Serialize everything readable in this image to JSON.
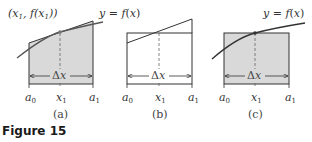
{
  "figure_label": "Figure 15",
  "panels": [
    {
      "id": "a",
      "caption": "(a)",
      "point_label": "(x₁, f(x₁))",
      "curve_label": "",
      "description": "Tangent-line trapezoid shaded under curve",
      "ticks": [
        "a₀",
        "x₁",
        "a₁"
      ],
      "width_label": "Δx"
    },
    {
      "id": "b",
      "caption": "(b)",
      "curve_label": "y = f(x)",
      "description": "Trapezoid vs rectangle outline (unshaded)",
      "ticks": [
        "a₀",
        "x₁",
        "a₁"
      ],
      "width_label": "Δx"
    },
    {
      "id": "c",
      "caption": "(c)",
      "curve_label": "y = f(x)",
      "description": "Midpoint rectangle shaded under curve",
      "ticks": [
        "a₀",
        "x₁",
        "a₁"
      ],
      "width_label": "Δx"
    }
  ],
  "colors": {
    "fill": "#d9d9d9",
    "stroke": "#333333",
    "curve": "#555555"
  }
}
